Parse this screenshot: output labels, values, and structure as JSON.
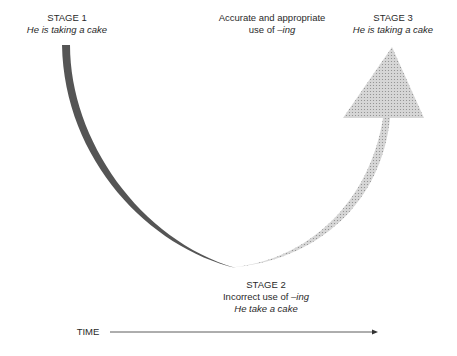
{
  "stage1": {
    "title": "STAGE 1",
    "example": "He is taking a cake"
  },
  "middle_note": {
    "line1": "Accurate and appropriate",
    "line2_prefix": "use of ",
    "line2_term": "–ing"
  },
  "stage3": {
    "title": "STAGE 3",
    "example": "He is taking a cake"
  },
  "stage2": {
    "title": "STAGE 2",
    "line2_prefix": "Incorrect use of ",
    "line2_term": "–ing",
    "example": "He take a cake"
  },
  "axis": {
    "label": "TIME"
  },
  "colors": {
    "dark_curve": "#555555",
    "dotted_fill": "#d4d4d4",
    "dot": "#8a8a8a",
    "text": "#2a2a2a"
  }
}
